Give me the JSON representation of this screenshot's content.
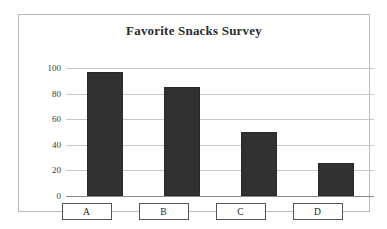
{
  "chart_data": {
    "type": "bar",
    "title": "Favorite Snacks Survey",
    "xlabel": "",
    "ylabel": "",
    "categories": [
      "A",
      "B",
      "C",
      "D"
    ],
    "values": [
      97,
      85,
      50,
      26
    ],
    "ylim": [
      0,
      100
    ],
    "yticks": [
      0,
      20,
      40,
      60,
      80,
      100
    ],
    "ytick_labels": [
      "0",
      "20",
      "40",
      "60",
      "80",
      "100"
    ],
    "grid": true,
    "legend": "none",
    "bar_color": "#333130",
    "frame_color": "#b9b9b9",
    "gridline_color": "#c8c8c8"
  }
}
